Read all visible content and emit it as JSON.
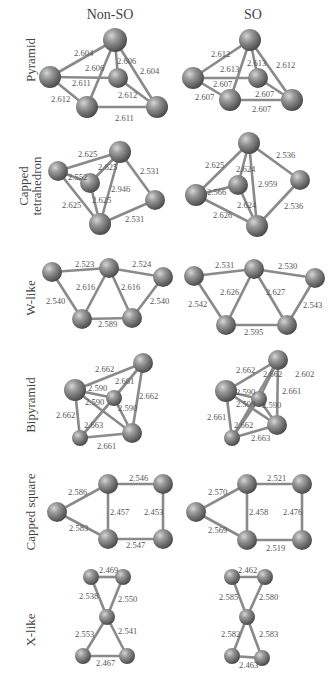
{
  "columns": {
    "left": "Non-SO",
    "right": "SO"
  },
  "rows": [
    {
      "label": "Pyramid",
      "nonso": {
        "atoms": [
          [
            115,
            40,
            12
          ],
          [
            50,
            77,
            11
          ],
          [
            118,
            78,
            10
          ],
          [
            87,
            107,
            11
          ],
          [
            157,
            107,
            11
          ]
        ],
        "bonds": [
          [
            0,
            1
          ],
          [
            0,
            2
          ],
          [
            0,
            3
          ],
          [
            0,
            4
          ],
          [
            1,
            2
          ],
          [
            1,
            3
          ],
          [
            2,
            4
          ],
          [
            3,
            4
          ]
        ],
        "labels": [
          [
            "2.604",
            74,
            56
          ],
          [
            "2.606",
            85,
            71
          ],
          [
            "2.606",
            117,
            64
          ],
          [
            "2.604",
            140,
            74
          ],
          [
            "2.611",
            72,
            86
          ],
          [
            "2.612",
            51,
            102
          ],
          [
            "2.612",
            118,
            98
          ],
          [
            "2.611",
            115,
            121
          ]
        ]
      },
      "so": {
        "atoms": [
          [
            250,
            40,
            11
          ],
          [
            193,
            78,
            11
          ],
          [
            258,
            78,
            10
          ],
          [
            230,
            100,
            11
          ],
          [
            292,
            100,
            11
          ]
        ],
        "bonds": [
          [
            0,
            1
          ],
          [
            0,
            2
          ],
          [
            0,
            3
          ],
          [
            0,
            4
          ],
          [
            1,
            2
          ],
          [
            1,
            3
          ],
          [
            2,
            4
          ],
          [
            3,
            4
          ]
        ],
        "labels": [
          [
            "2.612",
            211,
            57
          ],
          [
            "2.613",
            220,
            72
          ],
          [
            "2.613",
            247,
            66
          ],
          [
            "2.612",
            276,
            68
          ],
          [
            "2.607",
            213,
            87
          ],
          [
            "2.607",
            195,
            100
          ],
          [
            "2.607",
            255,
            97
          ],
          [
            "2.607",
            252,
            112
          ]
        ]
      }
    },
    {
      "label": "Capped tetrahedron",
      "nonso": {
        "atoms": [
          [
            120,
            152,
            11
          ],
          [
            58,
            171,
            10
          ],
          [
            90,
            183,
            10
          ],
          [
            155,
            200,
            10
          ],
          [
            100,
            224,
            11
          ]
        ],
        "bonds": [
          [
            0,
            1
          ],
          [
            0,
            2
          ],
          [
            0,
            3
          ],
          [
            0,
            4
          ],
          [
            1,
            2
          ],
          [
            1,
            4
          ],
          [
            2,
            4
          ],
          [
            3,
            4
          ]
        ],
        "labels": [
          [
            "2.625",
            78,
            157
          ],
          [
            "2.625",
            98,
            170
          ],
          [
            "2.552",
            68,
            180
          ],
          [
            "2.531",
            140,
            174
          ],
          [
            "2.946",
            111,
            192
          ],
          [
            "2.625",
            62,
            208
          ],
          [
            "2.625",
            92,
            203
          ],
          [
            "2.531",
            125,
            222
          ]
        ]
      },
      "so": {
        "atoms": [
          [
            249,
            143,
            11
          ],
          [
            196,
            195,
            11
          ],
          [
            238,
            185,
            10
          ],
          [
            300,
            180,
            10
          ],
          [
            257,
            226,
            11
          ]
        ],
        "bonds": [
          [
            0,
            1
          ],
          [
            0,
            2
          ],
          [
            0,
            3
          ],
          [
            0,
            4
          ],
          [
            1,
            2
          ],
          [
            1,
            4
          ],
          [
            2,
            4
          ],
          [
            3,
            4
          ]
        ],
        "labels": [
          [
            "2.625",
            205,
            168
          ],
          [
            "2.624",
            236,
            172
          ],
          [
            "2.536",
            276,
            158
          ],
          [
            "2.959",
            258,
            187
          ],
          [
            "2.566",
            207,
            195
          ],
          [
            "2.624",
            237,
            208
          ],
          [
            "2.626",
            213,
            218
          ],
          [
            "2.536",
            284,
            209
          ]
        ]
      }
    },
    {
      "label": "W-like",
      "nonso": {
        "atoms": [
          [
            52,
            272,
            10
          ],
          [
            109,
            268,
            10
          ],
          [
            163,
            277,
            10
          ],
          [
            82,
            319,
            10
          ],
          [
            132,
            318,
            10
          ]
        ],
        "bonds": [
          [
            0,
            1
          ],
          [
            1,
            2
          ],
          [
            0,
            3
          ],
          [
            1,
            3
          ],
          [
            1,
            4
          ],
          [
            2,
            4
          ],
          [
            3,
            4
          ]
        ],
        "labels": [
          [
            "2.523",
            75,
            267
          ],
          [
            "2.524",
            132,
            267
          ],
          [
            "2.616",
            76,
            290
          ],
          [
            "2.616",
            121,
            290
          ],
          [
            "2.540",
            46,
            304
          ],
          [
            "2.540",
            150,
            304
          ],
          [
            "2.589",
            98,
            327
          ]
        ]
      },
      "so": {
        "atoms": [
          [
            194,
            276,
            10
          ],
          [
            254,
            269,
            10
          ],
          [
            315,
            278,
            10
          ],
          [
            226,
            325,
            10
          ],
          [
            287,
            325,
            10
          ]
        ],
        "bonds": [
          [
            0,
            1
          ],
          [
            1,
            2
          ],
          [
            0,
            3
          ],
          [
            1,
            3
          ],
          [
            1,
            4
          ],
          [
            2,
            4
          ],
          [
            3,
            4
          ]
        ],
        "labels": [
          [
            "2.531",
            215,
            268
          ],
          [
            "2.530",
            278,
            269
          ],
          [
            "2.626",
            220,
            295
          ],
          [
            "2.627",
            266,
            295
          ],
          [
            "2.542",
            188,
            307
          ],
          [
            "2.543",
            303,
            308
          ],
          [
            "2.595",
            244,
            335
          ]
        ]
      }
    },
    {
      "label": "Bipyramid",
      "nonso": {
        "atoms": [
          [
            143,
            363,
            10
          ],
          [
            75,
            390,
            11
          ],
          [
            114,
            398,
            8
          ],
          [
            80,
            438,
            8
          ],
          [
            132,
            433,
            10
          ]
        ],
        "bonds": [
          [
            0,
            1
          ],
          [
            0,
            2
          ],
          [
            0,
            3
          ],
          [
            0,
            4
          ],
          [
            1,
            2
          ],
          [
            1,
            3
          ],
          [
            1,
            4
          ],
          [
            2,
            3
          ],
          [
            2,
            4
          ],
          [
            3,
            4
          ]
        ],
        "labels": [
          [
            "2.662",
            95,
            372
          ],
          [
            "2.661",
            115,
            384
          ],
          [
            "2.590",
            88,
            391
          ],
          [
            "2.662",
            139,
            399
          ],
          [
            "2.590",
            85,
            405
          ],
          [
            "2.590",
            118,
            411
          ],
          [
            "2.662",
            56,
            418
          ],
          [
            "2.663",
            84,
            428
          ],
          [
            "2.661",
            97,
            449
          ]
        ]
      },
      "so": {
        "atoms": [
          [
            278,
            360,
            10
          ],
          [
            226,
            391,
            11
          ],
          [
            259,
            399,
            8
          ],
          [
            232,
            438,
            8
          ],
          [
            277,
            425,
            10
          ]
        ],
        "bonds": [
          [
            0,
            1
          ],
          [
            0,
            2
          ],
          [
            0,
            3
          ],
          [
            0,
            4
          ],
          [
            1,
            2
          ],
          [
            1,
            3
          ],
          [
            1,
            4
          ],
          [
            2,
            3
          ],
          [
            2,
            4
          ],
          [
            3,
            4
          ]
        ],
        "labels": [
          [
            "2.662",
            236,
            373
          ],
          [
            "2.662",
            263,
            377
          ],
          [
            "2.602",
            295,
            377
          ],
          [
            "2.661",
            282,
            394
          ],
          [
            "2.590",
            236,
            395
          ],
          [
            "2.590",
            236,
            407
          ],
          [
            "2.590",
            262,
            408
          ],
          [
            "2.661",
            207,
            420
          ],
          [
            "2.662",
            234,
            428
          ],
          [
            "2.663",
            251,
            441
          ]
        ]
      }
    },
    {
      "label": "Capped square",
      "nonso": {
        "atoms": [
          [
            57,
            512,
            10
          ],
          [
            108,
            484,
            10
          ],
          [
            163,
            484,
            10
          ],
          [
            108,
            539,
            10
          ],
          [
            163,
            539,
            10
          ]
        ],
        "bonds": [
          [
            0,
            1
          ],
          [
            0,
            3
          ],
          [
            1,
            2
          ],
          [
            1,
            3
          ],
          [
            2,
            4
          ],
          [
            3,
            4
          ]
        ],
        "labels": [
          [
            "2.586",
            68,
            495
          ],
          [
            "2.546",
            129,
            481
          ],
          [
            "2.457",
            110,
            515
          ],
          [
            "2.453",
            144,
            515
          ],
          [
            "2.583",
            69,
            531
          ],
          [
            "2.547",
            126,
            548
          ]
        ]
      },
      "so": {
        "atoms": [
          [
            196,
            512,
            10
          ],
          [
            247,
            484,
            10
          ],
          [
            302,
            484,
            10
          ],
          [
            247,
            540,
            10
          ],
          [
            302,
            540,
            10
          ]
        ],
        "bonds": [
          [
            0,
            1
          ],
          [
            0,
            3
          ],
          [
            1,
            2
          ],
          [
            1,
            3
          ],
          [
            2,
            4
          ],
          [
            3,
            4
          ]
        ],
        "labels": [
          [
            "2.570",
            208,
            495
          ],
          [
            "2.521",
            267,
            481
          ],
          [
            "2.458",
            249,
            515
          ],
          [
            "2.476",
            283,
            515
          ],
          [
            "2.569",
            208,
            533
          ],
          [
            "2.519",
            266,
            551
          ]
        ]
      }
    },
    {
      "label": "X-like",
      "nonso": {
        "atoms": [
          [
            91,
            577,
            8
          ],
          [
            123,
            577,
            8
          ],
          [
            107,
            617,
            8
          ],
          [
            83,
            656,
            8
          ],
          [
            127,
            656,
            8
          ]
        ],
        "bonds": [
          [
            0,
            1
          ],
          [
            0,
            2
          ],
          [
            1,
            2
          ],
          [
            2,
            3
          ],
          [
            2,
            4
          ],
          [
            3,
            4
          ]
        ],
        "labels": [
          [
            "2.469",
            99,
            573
          ],
          [
            "2.538",
            79,
            599
          ],
          [
            "2.550",
            118,
            602
          ],
          [
            "2.553",
            75,
            637
          ],
          [
            "2.541",
            118,
            634
          ],
          [
            "2.467",
            96,
            666
          ]
        ]
      },
      "so": {
        "atoms": [
          [
            232,
            577,
            8
          ],
          [
            265,
            577,
            8
          ],
          [
            247,
            617,
            8
          ],
          [
            232,
            656,
            8
          ],
          [
            262,
            658,
            8
          ]
        ],
        "bonds": [
          [
            0,
            1
          ],
          [
            0,
            2
          ],
          [
            1,
            2
          ],
          [
            2,
            3
          ],
          [
            2,
            4
          ],
          [
            3,
            4
          ]
        ],
        "labels": [
          [
            "2.462",
            238,
            573
          ],
          [
            "2.585",
            219,
            600
          ],
          [
            "2.580",
            259,
            600
          ],
          [
            "2.582",
            221,
            637
          ],
          [
            "2.583",
            259,
            637
          ],
          [
            "2.463",
            239,
            668
          ]
        ]
      }
    }
  ],
  "row_label_centers": [
    60,
    186,
    298,
    405,
    512,
    630
  ]
}
